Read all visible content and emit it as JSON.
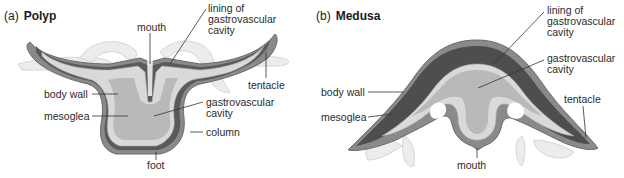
{
  "figure": {
    "panels": [
      {
        "id": "a",
        "letter": "(a)",
        "title": "Polyp",
        "labels": {
          "mouth": "mouth",
          "lining": "lining of\ngastrovascular\ncavity",
          "tentacle": "tentacle",
          "body_wall": "body wall",
          "mesoglea": "mesoglea",
          "gastrovascular_cavity": "gastrovascular\ncavity",
          "column": "column",
          "foot": "foot"
        }
      },
      {
        "id": "b",
        "letter": "(b)",
        "title": "Medusa",
        "labels": {
          "lining": "lining of\ngastrovascular\ncavity",
          "gastrovascular_cavity": "gastrovascular\ncavity",
          "body_wall": "body wall",
          "tentacle": "tentacle",
          "mesoglea": "mesoglea",
          "mouth": "mouth"
        }
      }
    ],
    "colors": {
      "outer_layer": "#8a8a8a",
      "mesoglea_dark": "#4e4e4e",
      "cell_layer": "#d9d9d9",
      "cavity": "#b9b9b9",
      "tentacle_pale": "#ececec",
      "leader_line": "#333333"
    }
  }
}
